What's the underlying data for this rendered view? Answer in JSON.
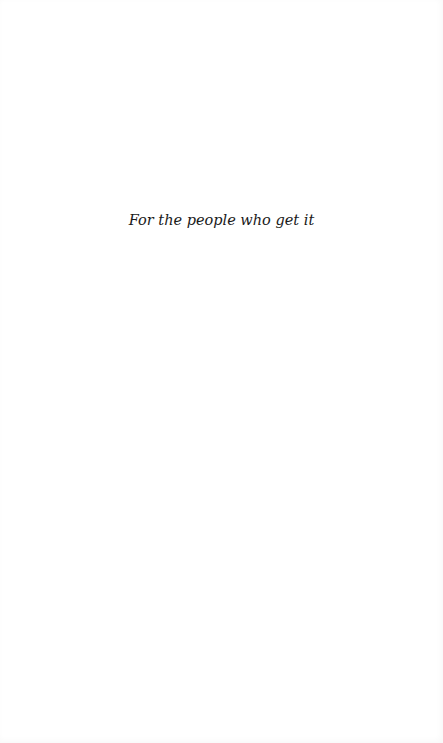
{
  "page": {
    "type": "dedication",
    "background_color": "#ffffff",
    "text_color": "#1a1a1a"
  },
  "dedication": {
    "text": "For the people who get it"
  }
}
